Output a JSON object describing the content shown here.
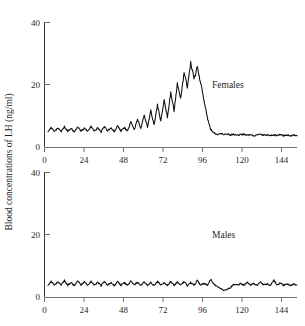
{
  "chart_data": {
    "type": "line",
    "title": "",
    "xlabel": "Hours",
    "ylabel": "Blood concentrations of LH (ng/ml)",
    "xlim": [
      0,
      152
    ],
    "ylim": [
      0,
      40
    ],
    "xticks": [
      0,
      24,
      48,
      72,
      96,
      120,
      144
    ],
    "yticks": [
      0,
      20,
      40
    ],
    "grid": false,
    "legend_position": "inline-annotation",
    "panels": [
      {
        "name": "females",
        "annotation": "Females",
        "annotation_at": {
          "x": 104,
          "y": 20
        },
        "ylim": [
          0,
          40
        ],
        "yticks": [
          0,
          20,
          40
        ],
        "description": "Pulsatile baseline near 5 ng/ml rising to a large preovulatory surge peaking about 27 ng/ml near hour 88, then an abrupt fall to a low plateau near 4 ng/ml",
        "x": [
          2,
          4,
          6,
          8,
          10,
          12,
          14,
          16,
          18,
          20,
          22,
          24,
          26,
          28,
          30,
          32,
          34,
          36,
          38,
          40,
          42,
          44,
          46,
          48,
          50,
          52,
          54,
          56,
          58,
          60,
          62,
          64,
          66,
          68,
          70,
          72,
          74,
          76,
          78,
          80,
          82,
          84,
          86,
          88,
          90,
          92,
          94,
          96,
          98,
          100,
          102,
          104,
          106,
          108,
          110,
          112,
          114,
          116,
          118,
          120,
          122,
          124,
          126,
          128,
          130,
          132,
          134,
          136,
          138,
          140,
          142,
          144,
          146,
          148,
          150,
          152
        ],
        "y": [
          5.2,
          6.4,
          5.0,
          6.2,
          5.1,
          6.6,
          5.2,
          6.1,
          5.0,
          6.5,
          5.3,
          6.2,
          5.1,
          6.8,
          5.2,
          6.3,
          5.0,
          6.6,
          5.4,
          6.2,
          5.1,
          6.9,
          5.3,
          6.4,
          5.2,
          8.2,
          5.6,
          9.1,
          6.0,
          10.4,
          6.6,
          11.8,
          7.2,
          13.6,
          8.4,
          15.2,
          9.6,
          17.8,
          11.8,
          20.4,
          15.6,
          23.8,
          19.4,
          27.2,
          22.0,
          25.6,
          20.8,
          15.2,
          9.6,
          5.8,
          4.6,
          4.2,
          4.4,
          4.1,
          4.3,
          4.0,
          4.2,
          3.9,
          4.1,
          4.2,
          3.9,
          4.1,
          3.8,
          4.0,
          4.2,
          3.9,
          4.1,
          3.8,
          4.0,
          3.9,
          4.1,
          3.8,
          4.0,
          3.7,
          3.9,
          3.8
        ],
        "peak": {
          "hour": 88,
          "value": 27.2
        },
        "baseline": 5.5,
        "post_surge_plateau": 4.0
      },
      {
        "name": "males",
        "annotation": "Males",
        "annotation_at": {
          "x": 104,
          "y": 20
        },
        "ylim": [
          0,
          40
        ],
        "yticks": [
          0,
          20,
          40
        ],
        "description": "Low pulsatile profile fluctuating around 4 ng/ml throughout, with a transient dip near hours 105-112",
        "x": [
          2,
          4,
          6,
          8,
          10,
          12,
          14,
          16,
          18,
          20,
          22,
          24,
          26,
          28,
          30,
          32,
          34,
          36,
          38,
          40,
          42,
          44,
          46,
          48,
          50,
          52,
          54,
          56,
          58,
          60,
          62,
          64,
          66,
          68,
          70,
          72,
          74,
          76,
          78,
          80,
          82,
          84,
          86,
          88,
          90,
          92,
          94,
          96,
          98,
          100,
          102,
          104,
          106,
          108,
          110,
          112,
          114,
          116,
          118,
          120,
          122,
          124,
          126,
          128,
          130,
          132,
          134,
          136,
          138,
          140,
          142,
          144,
          146,
          148,
          150,
          152
        ],
        "y": [
          4.0,
          5.2,
          3.8,
          5.0,
          4.0,
          5.4,
          3.9,
          4.8,
          3.8,
          5.3,
          4.0,
          5.1,
          3.8,
          5.2,
          3.9,
          4.9,
          3.8,
          5.0,
          4.0,
          4.7,
          3.8,
          5.1,
          3.9,
          4.8,
          3.8,
          5.2,
          4.0,
          4.9,
          3.8,
          5.0,
          3.9,
          4.8,
          3.8,
          5.1,
          4.0,
          4.7,
          3.8,
          5.2,
          3.9,
          4.9,
          4.0,
          5.0,
          3.8,
          4.8,
          3.9,
          5.4,
          4.0,
          4.6,
          3.8,
          5.8,
          4.2,
          3.6,
          2.8,
          2.2,
          2.6,
          3.2,
          4.2,
          4.0,
          4.4,
          3.9,
          4.8,
          4.0,
          4.6,
          3.8,
          4.9,
          4.0,
          4.4,
          3.8,
          5.6,
          4.0,
          4.6,
          3.9,
          4.4,
          3.8,
          4.2,
          4.0
        ],
        "baseline": 4.2,
        "dip": {
          "hour_range": [
            104,
            112
          ],
          "min_value": 2.2
        }
      }
    ]
  },
  "colors": {
    "trace": "#0d0d0d",
    "axis": "#6f6f6f",
    "text": "#1f1f1f",
    "background": "#ffffff"
  },
  "labels": {
    "tick_0": "0",
    "tick_24": "24",
    "tick_48": "48",
    "tick_72": "72",
    "tick_96": "96",
    "tick_120": "120",
    "tick_144": "144",
    "y_tick_0": "0",
    "y_tick_20": "20",
    "y_tick_40": "40",
    "females": "Females",
    "males": "Males",
    "xaxis": "Hours",
    "yaxis": "Blood concentrations of LH (ng/ml)"
  }
}
